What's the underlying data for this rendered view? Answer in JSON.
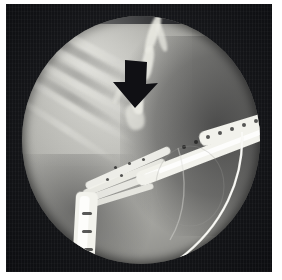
{
  "image": {
    "kind": "medical-radiograph",
    "modality": "fluoroscopy",
    "procedure": "ERCP cholangiogram",
    "view": "frontal",
    "caption": "",
    "width_px": 282,
    "height_px": 280
  },
  "frame": {
    "background_color": "#ffffff",
    "border_color": "#15161a",
    "left_px": 6,
    "top_px": 4,
    "width_px": 266,
    "height_px": 268
  },
  "field": {
    "shape": "circle-with-flat-top",
    "label": "collimated fluoroscopic field",
    "left_px": 16,
    "top_px": 12,
    "diameter_px": 238,
    "bright_tone": "#c9c9c4",
    "mid_tone": "#8e8e8a",
    "dark_tone": "#3a3a38"
  },
  "annotation": {
    "arrow": {
      "label": "black downward arrow",
      "direction": "down",
      "color": "#101014",
      "x_px": 113,
      "y_px": 60,
      "width_px": 46,
      "height_px": 49,
      "points_at": "bile duct stricture"
    }
  },
  "anatomy": {
    "structures": [
      {
        "name": "common-bile-duct",
        "tone": "#e9e9e2"
      },
      {
        "name": "intrahepatic-ducts",
        "tone": "#dedad2"
      },
      {
        "name": "duodenoscope-shaft",
        "tone": "#f2f2ec"
      },
      {
        "name": "scope-bending-section",
        "tone": "#ededE6"
      },
      {
        "name": "guidewire",
        "tone": "#f4f4ee"
      },
      {
        "name": "ribs",
        "tone": "#cfcfc9"
      },
      {
        "name": "gas-shadow",
        "tone": "#3a3a3c"
      }
    ]
  }
}
